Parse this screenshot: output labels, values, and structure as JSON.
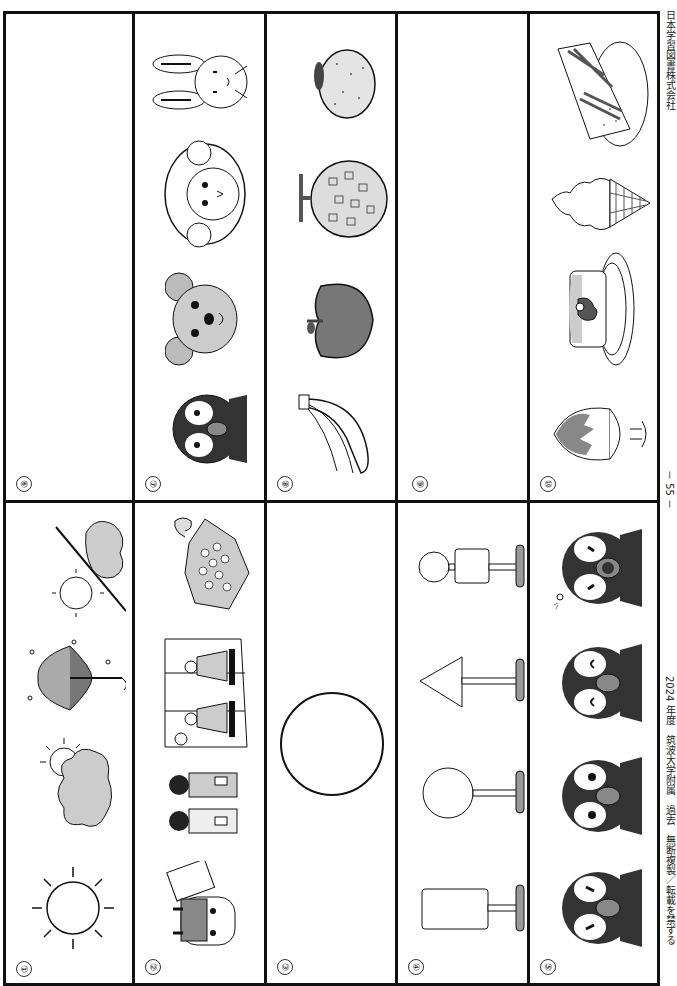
{
  "page": {
    "orientation": "rotated-90-clockwise",
    "page_number": "－ 55 －",
    "footer_left": "2024 年度　筑波大学附属　過去　無断複製／転載を禁ずる",
    "footer_right": "日本学習図書株式会社"
  },
  "questions": [
    {
      "number": "①",
      "items": [
        "sun (sunny)",
        "sun behind cloud (partly cloudy)",
        "umbrella with raindrops (rain)",
        "sun / cloud (sunny then cloudy)"
      ]
    },
    {
      "number": "②",
      "items": [
        "oni mask with bean box (Setsubun)",
        "children in kimono (Shichi-Go-San)",
        "hina dolls with folding screen (Hinamatsuri)",
        "hydrangea with snail (rainy season)"
      ]
    },
    {
      "number": "③",
      "items": [
        "large circle"
      ]
    },
    {
      "number": "④",
      "items": [
        "rectangle sign on stand",
        "circle sign on stand",
        "triangle sign on stand",
        "circle and square sign on stand"
      ]
    },
    {
      "number": "⑤",
      "items": [
        "crying penguin",
        "surprised penguin",
        "smiling penguin",
        "sleepy penguin"
      ]
    },
    {
      "number": "⑥",
      "items": []
    },
    {
      "number": "⑦",
      "items": [
        "penguin",
        "dog",
        "sheep",
        "rabbit"
      ]
    },
    {
      "number": "⑧",
      "items": [
        "bananas",
        "apple",
        "melon",
        "orange"
      ]
    },
    {
      "number": "⑨",
      "items": []
    },
    {
      "number": "⑩",
      "items": [
        "shaved ice",
        "pudding on plate",
        "ice cream cone",
        "sandwich on plate"
      ]
    }
  ]
}
